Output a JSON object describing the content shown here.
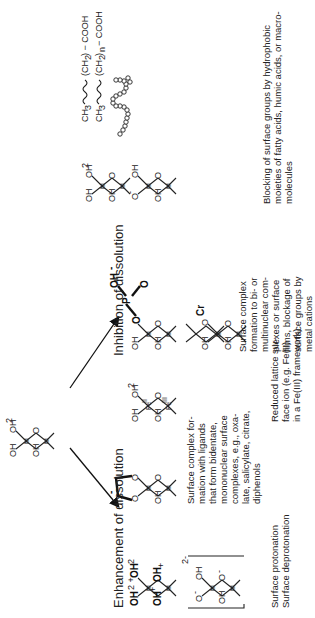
{
  "diagram": {
    "type": "surface-chemistry-schematic",
    "orientation": "rotated-90-ccw",
    "center_structure": {
      "label": "central-surface-unit",
      "groups": [
        "OH",
        "OH",
        "OH2",
        "M",
        "M",
        "O"
      ]
    },
    "branches": {
      "enhancement": {
        "title": "Enhancement of dissolution",
        "items": [
          {
            "caption": "Surface protonation\nSurface deprotonation",
            "structures": [
              {
                "groups": [
                  "OH2+",
                  "OH2",
                  "OH2+",
                  "OH+",
                  "M",
                  "M"
                ]
              },
              {
                "groups": [
                  "OH",
                  "O-",
                  "O-",
                  "OH",
                  "M",
                  "M"
                ],
                "charge": "2-"
              }
            ]
          },
          {
            "caption": "Surface complex formation with ligands that form bidentate, mononuclear surface complexes, e.g., oxalate, salicylate, citrate, diphenols",
            "structures": [
              {
                "groups": [
                  "OH",
                  "O",
                  "O",
                  "O",
                  "M",
                  "M"
                ],
                "ligand_charge": "-"
              }
            ]
          },
          {
            "caption": "Reduced lattice surface ion (e.g. Fe(II) in a Fe(III) framework)",
            "structures": [
              {
                "groups": [
                  "OH",
                  "OH",
                  "OH2",
                  "O",
                  "Fe(III)",
                  "Fe(II)"
                ]
              }
            ]
          }
        ]
      },
      "inhibition": {
        "title": "Inhibition of dissolution",
        "items": [
          {
            "caption": "Surface complex formation to bi- or multinuclear complexes or surface films, blockage of surface groups by metal cations",
            "structures": [
              {
                "groups": [
                  "OH",
                  "O",
                  "O",
                  "P",
                  "O",
                  "OH-"
                ]
              },
              {
                "groups": [
                  "OH",
                  "O",
                  "OH",
                  "OCr",
                  "M",
                  "M"
                ]
              }
            ]
          },
          {
            "caption": "Blocking of surface groups  by hydrophobic moieties of fatty acids, humic acids, or macromolecules",
            "structures": [
              {
                "groups": [
                  "OH",
                  "OH",
                  "OH2",
                  "M",
                  "M"
                ]
              },
              {
                "groups": [
                  "OH",
                  "OH",
                  "O-",
                  "M",
                  "M"
                ]
              },
              {
                "formula": "CH3 ~~~~ (CH2) − COOH"
              },
              {
                "formula": "CH3 ~~~~ (CH2)n − COOH"
              },
              {
                "macromolecule": "bead-chain"
              }
            ]
          }
        ]
      }
    },
    "captions_text": {
      "protonation": [
        "Surface protonation",
        "Surface deprotonation"
      ],
      "bidentate": [
        "Surface complex for-",
        "mation with ligands",
        "that form bidentate,",
        "mononuclear surface",
        "complexes, e.g., oxa-",
        "late, salicylate, citrate,",
        "diphenols"
      ],
      "reduced": [
        "Reduced lattice sur-",
        "face ion (e.g. Fe(II)",
        "in a Fe(III) framework)"
      ],
      "multinuclear": [
        "Surface complex",
        "formation to bi- or",
        "multinuclear com-",
        "plexes or surface",
        "films, blockage of",
        "surface groups by",
        "metal cations"
      ],
      "blocking": [
        "Blocking of surface groups  by hydrophobic",
        "moieties of fatty acids, humic acids, or macro-",
        "molecules"
      ]
    },
    "labels": {
      "OH": "OH",
      "OH2": "OH",
      "sub2": "2",
      "O": "O",
      "M": "M",
      "P": "P",
      "Cr": "Cr",
      "plus": "+",
      "minus": "-",
      "charge2": "2-",
      "FeII": "Fe",
      "FeIII": "Fe",
      "roman2": "II",
      "roman3": "III",
      "CH3": "CH",
      "sub3": "3",
      "CH2paren": "(CH",
      "close": ")",
      "closen": ")n",
      "COOH": " − COOH"
    }
  }
}
